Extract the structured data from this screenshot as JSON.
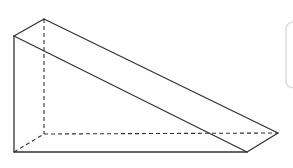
{
  "diagram": {
    "type": "triangular-prism",
    "vertices": {
      "front_top": [
        14,
        36
      ],
      "front_bottom_left": [
        14,
        152
      ],
      "front_bottom_right": [
        247,
        152
      ],
      "back_top": [
        44,
        19
      ],
      "back_bottom_left": [
        44,
        134
      ],
      "back_bottom_right": [
        278,
        133
      ]
    },
    "colors": {
      "line": "#333333",
      "panel_border": "#d0d0d0",
      "background": "#ffffff"
    }
  }
}
